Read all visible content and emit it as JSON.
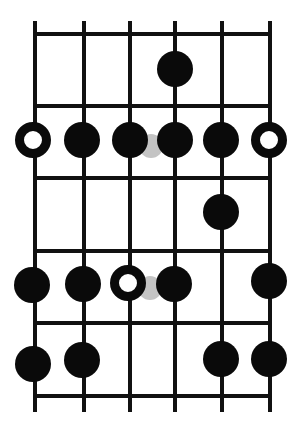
{
  "diagram": {
    "type": "guitar-scale-fretboard",
    "canvas": {
      "width": 305,
      "height": 430,
      "background": "#ffffff"
    },
    "colors": {
      "line": "#111111",
      "dot": "#0a0a0a",
      "root_fill": "#ffffff",
      "ghost": "#c4c4c4"
    },
    "strings_x": [
      35,
      84,
      130,
      175,
      222,
      270
    ],
    "string_top": 21,
    "string_bottom": 412,
    "frets_y": [
      34,
      106,
      178,
      251,
      323,
      396
    ],
    "fret_x_start": 33,
    "fret_x_end": 272,
    "line_width": 4,
    "dot_radius": 18,
    "root_inner_radius": 9,
    "ghost_radius": 12,
    "notes": [
      {
        "string": 4,
        "cx": 175,
        "cy": 69,
        "kind": "filled"
      },
      {
        "string": 1,
        "cx": 33,
        "cy": 140,
        "kind": "root"
      },
      {
        "string": 2,
        "cx": 82,
        "cy": 140,
        "kind": "filled"
      },
      {
        "string": 3,
        "cx": 130,
        "cy": 140,
        "kind": "filled"
      },
      {
        "string": 4,
        "cx": 175,
        "cy": 140,
        "kind": "filled"
      },
      {
        "string": 5,
        "cx": 221,
        "cy": 140,
        "kind": "filled"
      },
      {
        "string": 6,
        "cx": 269,
        "cy": 140,
        "kind": "root"
      },
      {
        "string": 5,
        "cx": 221,
        "cy": 212,
        "kind": "filled"
      },
      {
        "string": 1,
        "cx": 32,
        "cy": 285,
        "kind": "filled"
      },
      {
        "string": 2,
        "cx": 83,
        "cy": 284,
        "kind": "filled"
      },
      {
        "string": 3,
        "cx": 128,
        "cy": 283,
        "kind": "root"
      },
      {
        "string": 4,
        "cx": 174,
        "cy": 284,
        "kind": "filled"
      },
      {
        "string": 6,
        "cx": 269,
        "cy": 281,
        "kind": "filled"
      },
      {
        "string": 1,
        "cx": 33,
        "cy": 364,
        "kind": "filled"
      },
      {
        "string": 2,
        "cx": 82,
        "cy": 360,
        "kind": "filled"
      },
      {
        "string": 5,
        "cx": 221,
        "cy": 359,
        "kind": "filled"
      },
      {
        "string": 6,
        "cx": 269,
        "cy": 359,
        "kind": "filled"
      }
    ],
    "ghost_notes": [
      {
        "cx": 151,
        "cy": 146
      },
      {
        "cx": 150,
        "cy": 288
      }
    ]
  }
}
